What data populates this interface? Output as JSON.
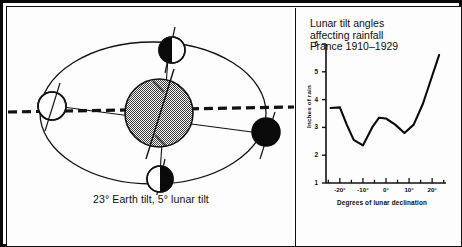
{
  "figure": {
    "orbit": {
      "caption": "23° Earth tilt, 5° lunar tilt",
      "earth_label": "Earth",
      "bodies": [
        {
          "name": "moon-new",
          "phase": "full-white",
          "position": "left"
        },
        {
          "name": "moon-first",
          "phase": "left-black",
          "position": "top"
        },
        {
          "name": "moon-full",
          "phase": "full-black",
          "position": "right"
        },
        {
          "name": "moon-last",
          "phase": "right-black",
          "position": "bottom"
        }
      ],
      "ecliptic_line": "dashed",
      "orbit_shape": "ellipse"
    },
    "chart": {
      "title_line_1": "Lunar tilt angles",
      "title_line_2": "affecting rainfall",
      "title_line_3": "France 1910–1929"
    }
  },
  "chart_data": {
    "type": "line",
    "title": "Lunar tilt angles affecting rainfall France 1910–1929",
    "xlabel": "Degrees of lunar declination",
    "ylabel": "Inches of rain",
    "xlim": [
      -26,
      26
    ],
    "ylim": [
      1,
      6
    ],
    "xticks": [
      -20,
      -10,
      0,
      10,
      20
    ],
    "xtick_labels": [
      "-20°",
      "-10°",
      "0°",
      "10°",
      "20°"
    ],
    "yticks": [
      1,
      2,
      3,
      4,
      5,
      6
    ],
    "ytick_labels": [
      "1",
      "2",
      "3",
      "4",
      "5",
      "6"
    ],
    "grid": false,
    "legend": null,
    "x": [
      -24,
      -20,
      -17,
      -14,
      -10,
      -6,
      -3,
      0,
      4,
      8,
      12,
      16,
      20,
      23
    ],
    "values": [
      3.7,
      3.72,
      3.1,
      2.55,
      2.35,
      3.0,
      3.35,
      3.32,
      3.1,
      2.8,
      3.1,
      3.85,
      4.85,
      5.6
    ]
  }
}
